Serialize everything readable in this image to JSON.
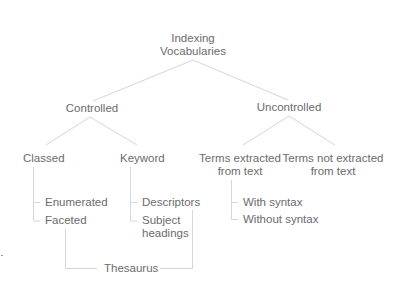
{
  "diagram": {
    "root": {
      "line1": "Indexing",
      "line2": "Vocabularies"
    },
    "level1": [
      {
        "label": "Controlled"
      },
      {
        "label": "Uncontrolled"
      }
    ],
    "controlled_children": [
      {
        "label": "Classed",
        "children": [
          "Enumerated",
          "Faceted"
        ]
      },
      {
        "label": "Keyword",
        "children": [
          "Descriptors",
          "Subject",
          "headings"
        ]
      }
    ],
    "uncontrolled_children": [
      {
        "line1": "Terms extracted",
        "line2": "from text",
        "children": [
          "With syntax",
          "Without syntax"
        ]
      },
      {
        "line1": "Terms not extracted",
        "line2": "from text"
      }
    ],
    "thesaurus": {
      "label": "Thesaurus"
    },
    "colors": {
      "line": "#d9d9d9",
      "text": "#6b6b6b",
      "background": "#ffffff"
    }
  }
}
